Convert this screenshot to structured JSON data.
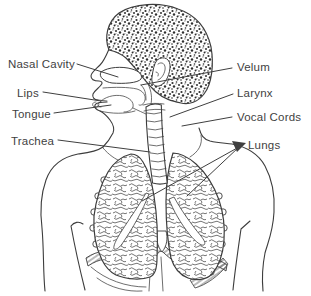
{
  "figure": {
    "background": "#ffffff",
    "stroke_color": "#3d3d3d",
    "text_color": "#3f3f3f",
    "labels": [
      {
        "id": "nasal-cavity",
        "text": "Nasal Cavity",
        "tx": 8,
        "ty": 68,
        "line": [
          [
            77,
            64
          ],
          [
            118,
            77
          ]
        ]
      },
      {
        "id": "lips",
        "text": "Lips",
        "tx": 17,
        "ty": 97,
        "line": [
          [
            43,
            92
          ],
          [
            101,
            101
          ]
        ]
      },
      {
        "id": "tongue",
        "text": "Tongue",
        "tx": 12,
        "ty": 118,
        "line": [
          [
            54,
            113
          ],
          [
            111,
            105
          ]
        ]
      },
      {
        "id": "trachea",
        "text": "Trachea",
        "tx": 11,
        "ty": 145,
        "line": [
          [
            58,
            140
          ],
          [
            150,
            152
          ]
        ]
      },
      {
        "id": "velum",
        "text": "Velum",
        "tx": 237,
        "ty": 71,
        "line": [
          [
            232,
            68
          ],
          [
            141,
            85
          ]
        ]
      },
      {
        "id": "larynx",
        "text": "Larynx",
        "tx": 237,
        "ty": 97,
        "line": [
          [
            233,
            94
          ],
          [
            170,
            117
          ]
        ]
      },
      {
        "id": "vocal-cords",
        "text": "Vocal Cords",
        "tx": 237,
        "ty": 121,
        "line": [
          [
            232,
            117
          ],
          [
            182,
            126
          ]
        ]
      },
      {
        "id": "lungs",
        "text": "Lungs",
        "tx": 248,
        "ty": 149,
        "line": [
          [
            239,
            147
          ],
          [
            142,
            201
          ]
        ],
        "line2": [
          [
            239,
            147
          ],
          [
            187,
            196
          ]
        ],
        "arrow": [
          [
            246,
            143
          ],
          [
            232,
            141
          ],
          [
            237,
            152
          ]
        ]
      }
    ]
  }
}
